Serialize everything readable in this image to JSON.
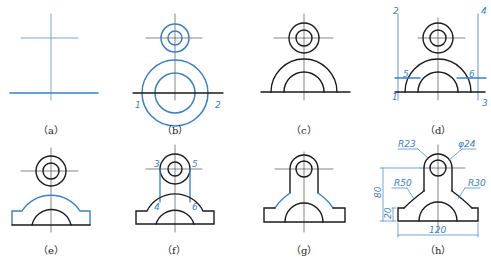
{
  "colors": {
    "outline": "#1a1a1a",
    "construction": "#3a7fc9",
    "centerline": "#333333",
    "background": "#ffffff"
  },
  "panels": [
    {
      "id": "a",
      "caption": "（a）"
    },
    {
      "id": "b",
      "caption": "（b）",
      "labels": [
        "1",
        "2"
      ]
    },
    {
      "id": "c",
      "caption": "（c）"
    },
    {
      "id": "d",
      "caption": "（d）",
      "labels": [
        "1",
        "2",
        "3",
        "4",
        "5",
        "6"
      ]
    },
    {
      "id": "e",
      "caption": "（e）"
    },
    {
      "id": "f",
      "caption": "（f）",
      "labels": [
        "3",
        "4",
        "5",
        "6"
      ]
    },
    {
      "id": "g",
      "caption": "（g）"
    },
    {
      "id": "h",
      "caption": "（h）",
      "dimensions": {
        "r_top": "R23",
        "hole": "φ24",
        "r_left": "R50",
        "r_right": "R30",
        "height": "80",
        "base_height": "20",
        "width": "120"
      }
    }
  ]
}
